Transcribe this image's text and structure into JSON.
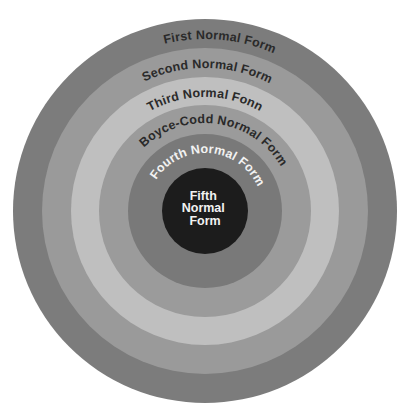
{
  "diagram": {
    "center": {
      "cx": 205,
      "cy": 211
    },
    "rings": [
      {
        "label": "First Normal Form",
        "radius": 192,
        "color": "#7c7c7c",
        "text_color": "#2a2a2a",
        "text_radius": 172,
        "text_offset_deg": 5
      },
      {
        "label": "Second Normal Form",
        "radius": 163,
        "color": "#9a9a9a",
        "text_color": "#2a2a2a",
        "text_radius": 143,
        "text_offset_deg": 1
      },
      {
        "label": "Third Normal Fonn",
        "radius": 134,
        "color": "#bfbfbf",
        "text_color": "#2a2a2a",
        "text_radius": 114,
        "text_offset_deg": 0
      },
      {
        "label": "Boyce-Codd Normal Form",
        "radius": 106,
        "color": "#9b9b9b",
        "text_color": "#2a2a2a",
        "text_radius": 88,
        "text_offset_deg": 8
      },
      {
        "label": "Fourth Normal Form",
        "radius": 77,
        "color": "#797979",
        "text_color": "#f2f2f2",
        "text_radius": 58,
        "text_offset_deg": 4
      }
    ],
    "core": {
      "radius": 43,
      "color": "#1c1c1c",
      "text_color": "#f2f2f2",
      "lines": [
        "Fifth",
        "Normal",
        "Form"
      ]
    }
  }
}
